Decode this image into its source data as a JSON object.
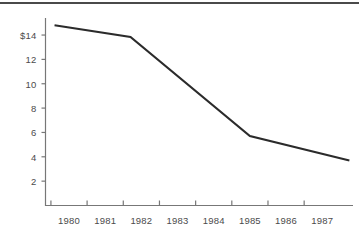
{
  "chart_data": {
    "type": "line",
    "title": "",
    "subtitle": "",
    "xlabel": "",
    "ylabel": "",
    "grid": false,
    "legend": false,
    "legend_position": "none",
    "line_color": "#2b2b2b",
    "axis_color": "#777777",
    "text_color": "#4b4b4b",
    "background": "#ffffff",
    "xlim": [
      1979.35,
      1987.85
    ],
    "ylim": [
      0,
      15.4
    ],
    "x_tick_labels": [
      "1980",
      "1981",
      "1982",
      "1983",
      "1984",
      "1985",
      "1986",
      "1987"
    ],
    "x_tick_values": [
      1980,
      1981,
      1982,
      1983,
      1984,
      1985,
      1986,
      1987
    ],
    "y_tick_labels": [
      "$14",
      "12",
      "10",
      "8",
      "6",
      "4",
      "2"
    ],
    "y_tick_values": [
      14,
      12,
      10,
      8,
      6,
      4,
      2
    ],
    "series": [
      {
        "name": "price",
        "x": [
          1979.6,
          1981.7,
          1985.0,
          1987.75
        ],
        "values": [
          14.8,
          13.85,
          5.7,
          3.7
        ]
      }
    ]
  },
  "page": {
    "top_rule": ""
  }
}
